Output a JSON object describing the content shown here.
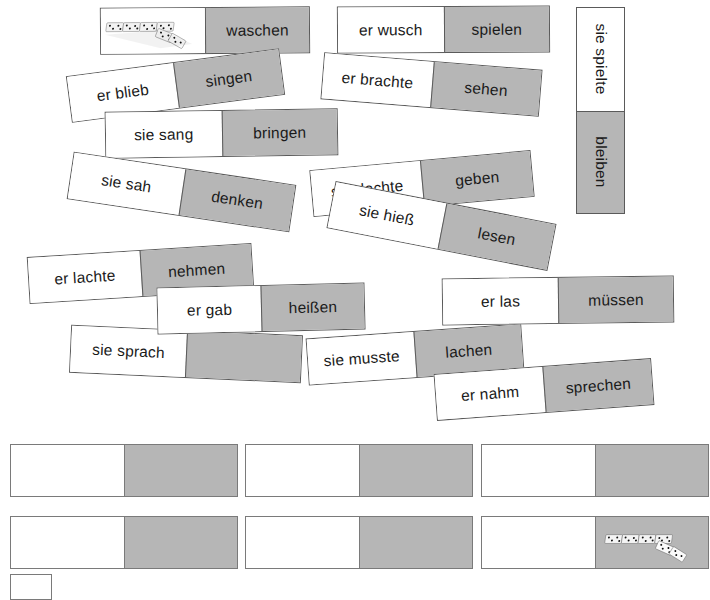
{
  "worksheet": {
    "title": "Verb domino cards (German past tense / infinitive)",
    "colors": {
      "gray_half": "#b6b6b6",
      "white_half": "#ffffff",
      "border": "#5a5a5a",
      "text": "#1a1a1a"
    }
  },
  "cards": [
    {
      "id": "c01",
      "white": "",
      "gray": "waschen",
      "white_has_image": true,
      "gray_has_image": false
    },
    {
      "id": "c02",
      "white": "er wusch",
      "gray": "spielen",
      "white_has_image": false,
      "gray_has_image": false
    },
    {
      "id": "c03",
      "white": "sie spielte",
      "gray": "bleiben",
      "white_has_image": false,
      "gray_has_image": false,
      "vertical": true
    },
    {
      "id": "c04",
      "white": "er blieb",
      "gray": "singen",
      "white_has_image": false,
      "gray_has_image": false
    },
    {
      "id": "c05",
      "white": "er brachte",
      "gray": "sehen",
      "white_has_image": false,
      "gray_has_image": false
    },
    {
      "id": "c06",
      "white": "sie sang",
      "gray": "bringen",
      "white_has_image": false,
      "gray_has_image": false
    },
    {
      "id": "c07",
      "white": "sie sah",
      "gray": "denken",
      "white_has_image": false,
      "gray_has_image": false
    },
    {
      "id": "c08",
      "white": "sie dachte",
      "gray": "geben",
      "white_has_image": false,
      "gray_has_image": false
    },
    {
      "id": "c09",
      "white": "sie hieß",
      "gray": "lesen",
      "white_has_image": false,
      "gray_has_image": false
    },
    {
      "id": "c10",
      "white": "er lachte",
      "gray": "nehmen",
      "white_has_image": false,
      "gray_has_image": false
    },
    {
      "id": "c11",
      "white": "er gab",
      "gray": "heißen",
      "white_has_image": false,
      "gray_has_image": false
    },
    {
      "id": "c12",
      "white": "er las",
      "gray": "müssen",
      "white_has_image": false,
      "gray_has_image": false
    },
    {
      "id": "c13",
      "white": "sie sprach",
      "gray": "",
      "white_has_image": false,
      "gray_has_image": false
    },
    {
      "id": "c14",
      "white": "sie musste",
      "gray": "lachen",
      "white_has_image": false,
      "gray_has_image": false
    },
    {
      "id": "c15",
      "white": "er nahm",
      "gray": "sprechen",
      "white_has_image": false,
      "gray_has_image": false
    }
  ],
  "blank_cards": [
    {
      "id": "b1",
      "white": "",
      "gray": "",
      "gray_has_image": false
    },
    {
      "id": "b2",
      "white": "",
      "gray": "",
      "gray_has_image": false
    },
    {
      "id": "b3",
      "white": "",
      "gray": "",
      "gray_has_image": false
    },
    {
      "id": "b4",
      "white": "",
      "gray": "",
      "gray_has_image": false
    },
    {
      "id": "b5",
      "white": "",
      "gray": "",
      "gray_has_image": false
    },
    {
      "id": "b6",
      "white": "",
      "gray": "",
      "gray_has_image": true
    }
  ],
  "images": {
    "domino_photo_label": "domino-tiles-photo"
  }
}
